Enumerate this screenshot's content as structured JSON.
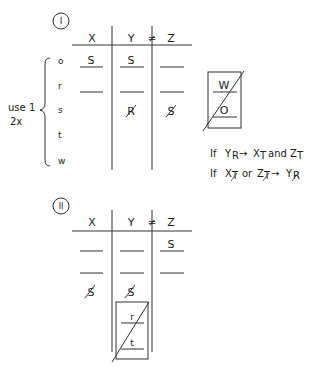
{
  "diagram_1": {
    "label": "I",
    "columns": [
      "X",
      "Y",
      "Z"
    ],
    "inequality": "≠",
    "rows": [
      "o",
      "r",
      "s",
      "t",
      "w"
    ],
    "side_note": {
      "line1": "use 1",
      "line2": "2x"
    },
    "cells": {
      "o_X": "S",
      "o_Y": "S",
      "o_Z": "",
      "s_Y": "R",
      "s_Z": "S"
    },
    "box": {
      "top": "W",
      "bottom": "O"
    }
  },
  "rules": {
    "rule1": {
      "prefix": "If",
      "a": "Y",
      "a_sub": "R",
      "arrow": "→",
      "b": "X",
      "b_sub": "T",
      "conj": "and",
      "c": "Z",
      "c_sub": "T"
    },
    "rule2": {
      "prefix": "If",
      "a": "X",
      "a_sub": "T",
      "conj": "or",
      "b": "Z",
      "b_sub": "T",
      "arrow": "→",
      "c": "Y",
      "c_sub": "R"
    }
  },
  "diagram_2": {
    "label": "II",
    "columns": [
      "X",
      "Y",
      "Z"
    ],
    "inequality": "≠",
    "cells": {
      "r1_Z": "S",
      "r3_X": "S",
      "r3_Y": "S"
    },
    "box": {
      "top": "r",
      "bottom": "t"
    }
  }
}
